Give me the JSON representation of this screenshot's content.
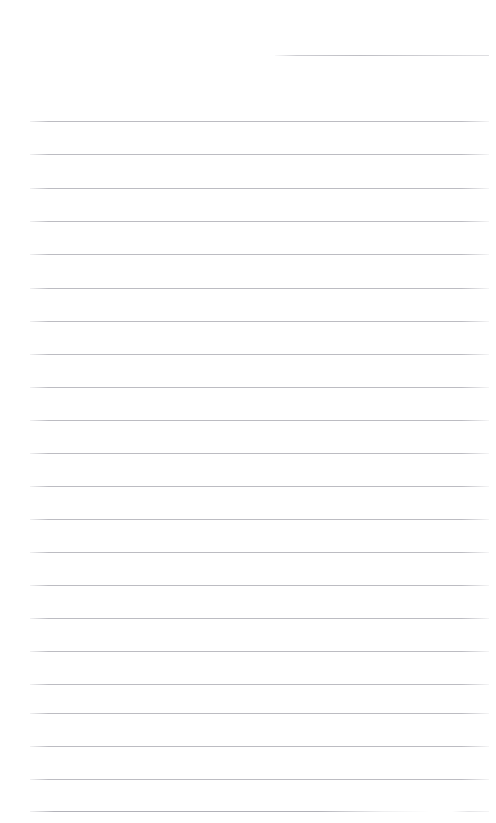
{
  "document": {
    "kind": "ruled-paper-sheet",
    "title": "Blank Lined Page",
    "page_width": 496,
    "page_height": 823,
    "background_color": "#ffffff",
    "rule_color": "#c9c9ce",
    "rule_thickness": 1,
    "rule_spacing": 33.2,
    "body_text": "",
    "content_note": "No text content is present on this page.",
    "margins": {
      "left": 30,
      "right": 8
    },
    "rules": [
      {
        "index": 1,
        "y": 55,
        "x_start": 275,
        "x_end": 489,
        "style": "fade-left"
      },
      {
        "index": 2,
        "y": 121,
        "x_start": 30,
        "x_end": 489,
        "style": "fade-both"
      },
      {
        "index": 3,
        "y": 154,
        "x_start": 30,
        "x_end": 489,
        "style": "fade-both"
      },
      {
        "index": 4,
        "y": 188,
        "x_start": 30,
        "x_end": 489,
        "style": "fade-both"
      },
      {
        "index": 5,
        "y": 221,
        "x_start": 30,
        "x_end": 489,
        "style": "fade-both"
      },
      {
        "index": 6,
        "y": 254,
        "x_start": 30,
        "x_end": 489,
        "style": "fade-both"
      },
      {
        "index": 7,
        "y": 288,
        "x_start": 30,
        "x_end": 489,
        "style": "fade-both"
      },
      {
        "index": 8,
        "y": 321,
        "x_start": 30,
        "x_end": 489,
        "style": "fade-both"
      },
      {
        "index": 9,
        "y": 354,
        "x_start": 30,
        "x_end": 489,
        "style": "fade-both"
      },
      {
        "index": 10,
        "y": 387,
        "x_start": 30,
        "x_end": 489,
        "style": "fade-both"
      },
      {
        "index": 11,
        "y": 420,
        "x_start": 30,
        "x_end": 489,
        "style": "fade-both"
      },
      {
        "index": 12,
        "y": 453,
        "x_start": 30,
        "x_end": 489,
        "style": "fade-both"
      },
      {
        "index": 13,
        "y": 486,
        "x_start": 30,
        "x_end": 489,
        "style": "fade-both"
      },
      {
        "index": 14,
        "y": 519,
        "x_start": 30,
        "x_end": 489,
        "style": "fade-both"
      },
      {
        "index": 15,
        "y": 552,
        "x_start": 30,
        "x_end": 489,
        "style": "fade-both"
      },
      {
        "index": 16,
        "y": 585,
        "x_start": 30,
        "x_end": 489,
        "style": "fade-both"
      },
      {
        "index": 17,
        "y": 618,
        "x_start": 30,
        "x_end": 489,
        "style": "fade-both"
      },
      {
        "index": 18,
        "y": 651,
        "x_start": 30,
        "x_end": 489,
        "style": "fade-both"
      },
      {
        "index": 19,
        "y": 684,
        "x_start": 30,
        "x_end": 489,
        "style": "fade-both"
      },
      {
        "index": 20,
        "y": 713,
        "x_start": 30,
        "x_end": 489,
        "style": "fade-both"
      },
      {
        "index": 21,
        "y": 746,
        "x_start": 30,
        "x_end": 489,
        "style": "fade-both"
      },
      {
        "index": 22,
        "y": 779,
        "x_start": 30,
        "x_end": 489,
        "style": "fade-both"
      },
      {
        "index": 23,
        "y": 811,
        "x_start": 30,
        "x_end": 430,
        "style": "fade-tail"
      },
      {
        "index": 24,
        "y": 811,
        "x_start": 452,
        "x_end": 489,
        "style": "stub"
      }
    ]
  }
}
